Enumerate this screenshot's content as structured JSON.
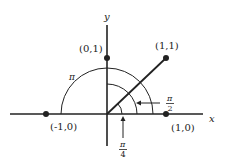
{
  "axes": {
    "x_label": "x",
    "y_label": "y"
  },
  "points": [
    {
      "label": "(0,1)",
      "x": 0,
      "y": 1
    },
    {
      "label": "(1,1)",
      "x": 1,
      "y": 1
    },
    {
      "label": "(-1,0)",
      "x": -1,
      "y": 0
    },
    {
      "label": "(1,0)",
      "x": 1,
      "y": 0
    }
  ],
  "angles": {
    "pi": {
      "label": "π"
    },
    "pi_over_2": {
      "num": "π",
      "den": "2"
    },
    "pi_over_4": {
      "num": "π",
      "den": "4"
    }
  },
  "colors": {
    "ink": "#222222",
    "background": "#ffffff"
  }
}
